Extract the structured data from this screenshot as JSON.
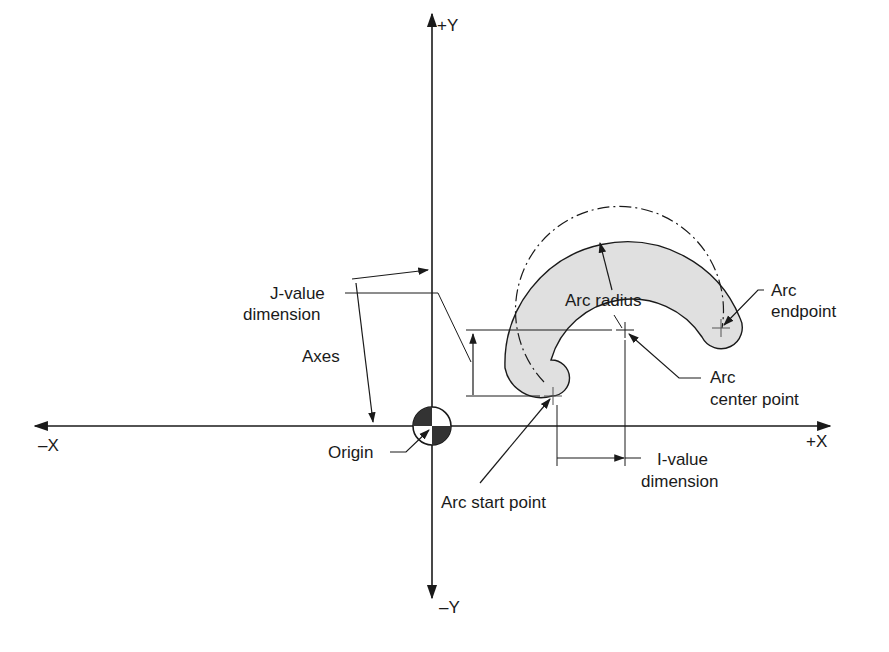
{
  "diagram": {
    "type": "CNC circular interpolation arc diagram",
    "colors": {
      "line": "#1a1a1a",
      "arc_fill": "#e0e0e0",
      "origin_dark": "#333333",
      "background": "#ffffff"
    },
    "axes": {
      "plus_y": "+Y",
      "minus_y": "–Y",
      "plus_x": "+X",
      "minus_x": "–X"
    },
    "labels": {
      "j_value_line1": "J-value",
      "j_value_line2": "dimension",
      "axes": "Axes",
      "origin": "Origin",
      "arc_radius": "Arc radius",
      "arc_endpoint_line1": "Arc",
      "arc_endpoint_line2": "endpoint",
      "arc_center_line1": "Arc",
      "arc_center_line2": "center point",
      "i_value_line1": "I-value",
      "i_value_line2": "dimension",
      "arc_start_point": "Arc start point"
    }
  }
}
